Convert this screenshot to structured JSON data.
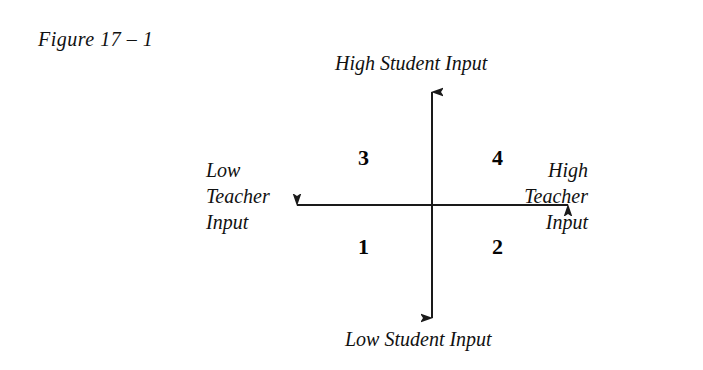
{
  "figure": {
    "caption": "Figure 17 – 1"
  },
  "diagram": {
    "type": "two-axis-quadrant",
    "axes": {
      "vertical": {
        "top_label": "High Student Input",
        "bottom_label": "Low Student Input"
      },
      "horizontal": {
        "left_label_lines": [
          "Low",
          "Teacher",
          "Input"
        ],
        "right_label_lines": [
          "High",
          "Teacher",
          "Input"
        ],
        "left_label": "Low Teacher Input",
        "right_label": "High Teacher Input"
      }
    },
    "quadrants": [
      {
        "id": "bottom-left",
        "number": "1"
      },
      {
        "id": "bottom-right",
        "number": "2"
      },
      {
        "id": "top-left",
        "number": "3"
      },
      {
        "id": "top-right",
        "number": "4"
      }
    ],
    "colors": {
      "background": "#ffffff",
      "ink": "#111111",
      "axis": "#1a1a1a"
    }
  }
}
